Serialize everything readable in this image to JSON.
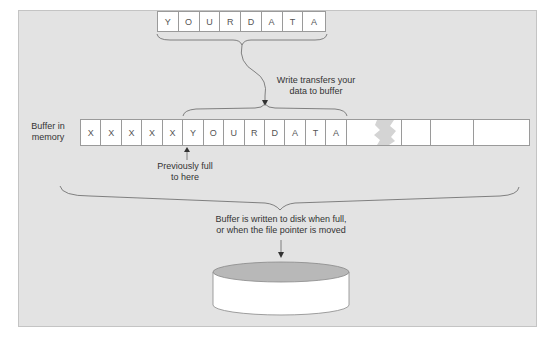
{
  "diagram": {
    "top_row": {
      "cells": [
        "Y",
        "O",
        "U",
        "R",
        "D",
        "A",
        "T",
        "A"
      ]
    },
    "write_label": {
      "line1": "Write transfers your",
      "line2": "data to buffer"
    },
    "buffer": {
      "label_line1": "Buffer in",
      "label_line2": "memory",
      "cells": [
        "X",
        "X",
        "X",
        "X",
        "X",
        "Y",
        "O",
        "U",
        "R",
        "D",
        "A",
        "T",
        "A"
      ],
      "trailing_empty_cells": 4,
      "torn_gap": true
    },
    "pointer_label": {
      "line1": "Previously full",
      "line2": "to here"
    },
    "disk_label": {
      "line1": "Buffer is written to disk when full,",
      "line2": "or when the file pointer is moved"
    },
    "disk": {
      "shape": "cylinder",
      "top_color": "#b8b8b8",
      "body_color": "#ffffff"
    },
    "colors": {
      "panel_background": "#e3e3e3",
      "stroke": "#555555",
      "cell_border": "#9a9a9a"
    }
  }
}
